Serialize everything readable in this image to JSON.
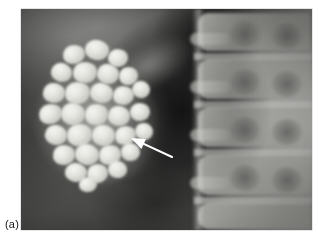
{
  "figure": {
    "panel_label": "(a)",
    "modality": "plain-abdominal-radiograph",
    "orientation": "AP supine",
    "caption_position": "bottom-left"
  },
  "image": {
    "frame": {
      "left": 21,
      "top": 9,
      "width": 291,
      "height": 221
    },
    "background_color": "#ffffff",
    "film_base_color": "#2a2a2a",
    "bone_color": "#c4c4c0",
    "stone_color": "#efefea",
    "gas_shadow_color": "#0c0c0c"
  },
  "anatomy": {
    "structures": [
      {
        "name": "gallbladder",
        "side": "right",
        "description": "pear-shaped soft-tissue opacity in right upper quadrant"
      },
      {
        "name": "gallstones",
        "count_visible": 30,
        "description": "numerous faceted radiopaque calculi packing the gallbladder lumen"
      },
      {
        "name": "lumbar-vertebrae",
        "side": "midline-right",
        "description": "lumbar vertebral bodies with intervertebral disc spaces and pedicles"
      },
      {
        "name": "bowel-gas",
        "description": "central dark gas-filled bowel shadow"
      },
      {
        "name": "psoas-margin",
        "description": "lateral psoas muscle border"
      }
    ]
  },
  "annotations": {
    "arrow": {
      "name": "pointer-arrow",
      "color": "#ffffff",
      "tail": {
        "x": 151,
        "y": 148
      },
      "tip": {
        "x": 110,
        "y": 129
      },
      "points_to": "gallbladder wall / stone margin",
      "direction": "up-left"
    }
  },
  "stones": [
    {
      "x": 36,
      "y": 14,
      "w": 22,
      "h": 19,
      "r": -12
    },
    {
      "x": 58,
      "y": 9,
      "w": 24,
      "h": 20,
      "r": 8
    },
    {
      "x": 81,
      "y": 18,
      "w": 20,
      "h": 18,
      "r": -4
    },
    {
      "x": 24,
      "y": 32,
      "w": 21,
      "h": 19,
      "r": 16
    },
    {
      "x": 46,
      "y": 31,
      "w": 24,
      "h": 21,
      "r": -8
    },
    {
      "x": 70,
      "y": 33,
      "w": 22,
      "h": 20,
      "r": 12
    },
    {
      "x": 92,
      "y": 36,
      "w": 19,
      "h": 18,
      "r": -16
    },
    {
      "x": 16,
      "y": 52,
      "w": 22,
      "h": 20,
      "r": 4
    },
    {
      "x": 38,
      "y": 51,
      "w": 25,
      "h": 22,
      "r": -10
    },
    {
      "x": 63,
      "y": 52,
      "w": 23,
      "h": 20,
      "r": 14
    },
    {
      "x": 86,
      "y": 55,
      "w": 21,
      "h": 19,
      "r": -6
    },
    {
      "x": 105,
      "y": 50,
      "w": 18,
      "h": 17,
      "r": 10
    },
    {
      "x": 12,
      "y": 73,
      "w": 23,
      "h": 20,
      "r": -14
    },
    {
      "x": 34,
      "y": 72,
      "w": 24,
      "h": 22,
      "r": 6
    },
    {
      "x": 58,
      "y": 73,
      "w": 23,
      "h": 21,
      "r": -12
    },
    {
      "x": 81,
      "y": 75,
      "w": 22,
      "h": 20,
      "r": 8
    },
    {
      "x": 103,
      "y": 72,
      "w": 20,
      "h": 18,
      "r": -4
    },
    {
      "x": 18,
      "y": 94,
      "w": 22,
      "h": 20,
      "r": 12
    },
    {
      "x": 40,
      "y": 93,
      "w": 25,
      "h": 22,
      "r": -8
    },
    {
      "x": 65,
      "y": 94,
      "w": 23,
      "h": 21,
      "r": 6
    },
    {
      "x": 88,
      "y": 95,
      "w": 21,
      "h": 19,
      "r": -14
    },
    {
      "x": 108,
      "y": 92,
      "w": 18,
      "h": 17,
      "r": 10
    },
    {
      "x": 26,
      "y": 114,
      "w": 22,
      "h": 20,
      "r": -6
    },
    {
      "x": 48,
      "y": 113,
      "w": 24,
      "h": 21,
      "r": 12
    },
    {
      "x": 72,
      "y": 114,
      "w": 22,
      "h": 20,
      "r": -10
    },
    {
      "x": 94,
      "y": 112,
      "w": 19,
      "h": 18,
      "r": 6
    },
    {
      "x": 38,
      "y": 132,
      "w": 22,
      "h": 19,
      "r": 8
    },
    {
      "x": 60,
      "y": 133,
      "w": 21,
      "h": 19,
      "r": -12
    },
    {
      "x": 81,
      "y": 130,
      "w": 19,
      "h": 17,
      "r": 4
    },
    {
      "x": 52,
      "y": 146,
      "w": 18,
      "h": 15,
      "r": -6
    }
  ],
  "vertebrae": [
    {
      "top": 4,
      "height": 38
    },
    {
      "top": 50,
      "height": 40
    },
    {
      "top": 98,
      "height": 40
    },
    {
      "top": 146,
      "height": 40
    },
    {
      "top": 194,
      "height": 26
    }
  ],
  "disc_spaces": [
    {
      "top": 44
    },
    {
      "top": 92
    },
    {
      "top": 140
    },
    {
      "top": 188
    }
  ],
  "pedicles": [
    {
      "left": 46,
      "top": 12
    },
    {
      "left": 88,
      "top": 14
    },
    {
      "left": 46,
      "top": 60
    },
    {
      "left": 88,
      "top": 62
    },
    {
      "left": 46,
      "top": 108
    },
    {
      "left": 88,
      "top": 110
    },
    {
      "left": 46,
      "top": 156
    },
    {
      "left": 88,
      "top": 158
    }
  ],
  "transverse_processes": [
    {
      "left": 6,
      "top": 24
    },
    {
      "left": 6,
      "top": 72
    },
    {
      "left": 6,
      "top": 120
    },
    {
      "left": 6,
      "top": 168
    }
  ]
}
